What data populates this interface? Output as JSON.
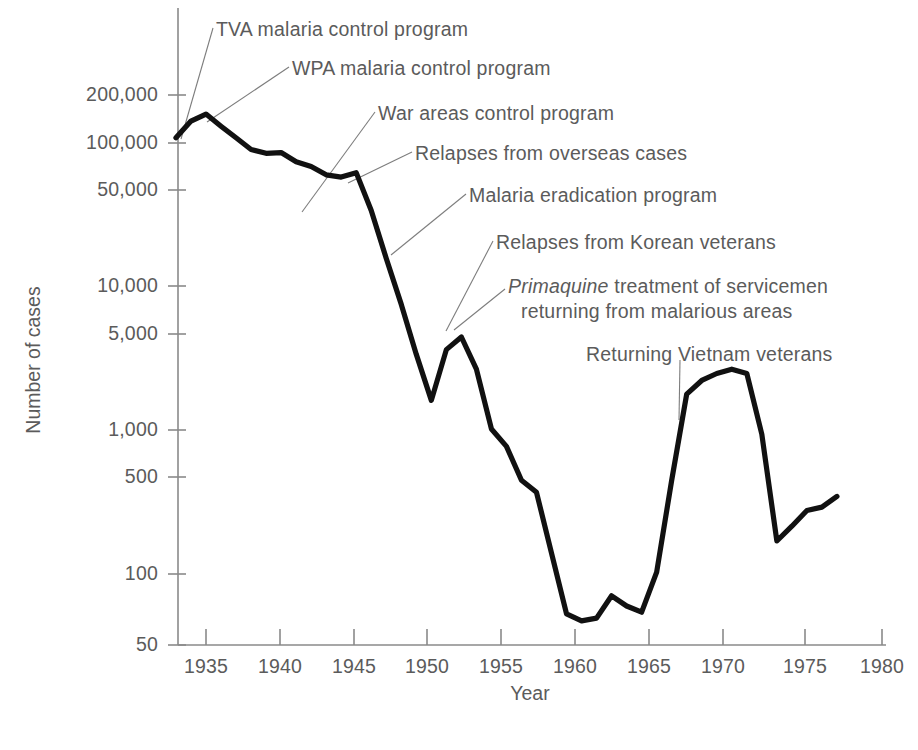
{
  "chart_data": {
    "type": "line",
    "title": "",
    "xlabel": "Year",
    "ylabel": "Number of cases",
    "yscale": "log",
    "xlim": [
      1933,
      1980
    ],
    "ylim": [
      50,
      250000
    ],
    "grid": false,
    "legend": "none",
    "yticks": [
      {
        "value": 200000,
        "label": "200,000"
      },
      {
        "value": 100000,
        "label": "100,000"
      },
      {
        "value": 50000,
        "label": "50,000"
      },
      {
        "value": 10000,
        "label": "10,000"
      },
      {
        "value": 5000,
        "label": "5,000"
      },
      {
        "value": 1000,
        "label": "1,000"
      },
      {
        "value": 500,
        "label": "500"
      },
      {
        "value": 100,
        "label": "100"
      },
      {
        "value": 50,
        "label": "50"
      }
    ],
    "xticks": [
      {
        "value": 1935,
        "label": "1935"
      },
      {
        "value": 1940,
        "label": "1940"
      },
      {
        "value": 1945,
        "label": "1945"
      },
      {
        "value": 1950,
        "label": "1950"
      },
      {
        "value": 1955,
        "label": "1955"
      },
      {
        "value": 1960,
        "label": "1960"
      },
      {
        "value": 1965,
        "label": "1965"
      },
      {
        "value": 1970,
        "label": "1970"
      },
      {
        "value": 1975,
        "label": "1975"
      },
      {
        "value": 1980,
        "label": "1980"
      }
    ],
    "series": [
      {
        "name": "Malaria cases",
        "x": [
          1933,
          1934,
          1935,
          1936,
          1937,
          1938,
          1939,
          1940,
          1941,
          1942,
          1943,
          1944,
          1945,
          1946,
          1947,
          1948,
          1949,
          1950,
          1951,
          1952,
          1953,
          1954,
          1955,
          1956,
          1957,
          1958,
          1959,
          1960,
          1961,
          1962,
          1963,
          1964,
          1965,
          1966,
          1967,
          1968,
          1969,
          1970,
          1971,
          1972,
          1973,
          1974,
          1975,
          1976,
          1977
        ],
        "y": [
          105000,
          135000,
          150000,
          125000,
          105000,
          88000,
          83000,
          84000,
          73000,
          68000,
          60000,
          58000,
          62000,
          35000,
          17000,
          8500,
          4000,
          2000,
          4300,
          5200,
          3200,
          1300,
          1000,
          600,
          500,
          200,
          80,
          72,
          75,
          105,
          90,
          82,
          150,
          600,
          2200,
          2700,
          3000,
          3200,
          3000,
          1200,
          240,
          300,
          380,
          400,
          470
        ]
      }
    ],
    "annotations": [
      {
        "text": "TVA malaria control program",
        "italic_prefix": ""
      },
      {
        "text": "WPA malaria control program",
        "italic_prefix": ""
      },
      {
        "text": "War areas control program",
        "italic_prefix": ""
      },
      {
        "text": "Relapses from overseas cases",
        "italic_prefix": ""
      },
      {
        "text": "Malaria eradication program",
        "italic_prefix": ""
      },
      {
        "text": "Relapses from Korean veterans",
        "italic_prefix": ""
      },
      {
        "text": " treatment of servicemen",
        "italic_prefix": "Primaquine"
      },
      {
        "text": "returning from malarious areas",
        "italic_prefix": ""
      },
      {
        "text": "Returning Vietnam veterans",
        "italic_prefix": ""
      }
    ],
    "colors": {
      "line": "#111111",
      "axis": "#8a8a8a",
      "text": "#5b5b5b",
      "leader": "#7d7d7d"
    }
  }
}
